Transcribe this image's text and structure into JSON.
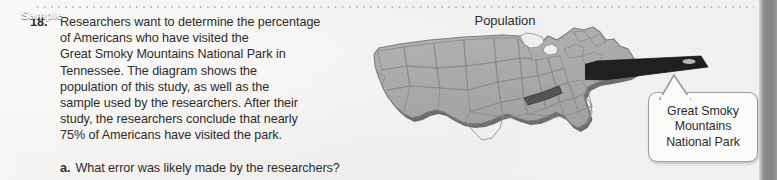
{
  "page": {
    "background_color": "#f3f2f0",
    "text_color": "#2e2c2b",
    "edge_band_color": "#8e8d8b",
    "dot_rule_color": "#c3c2c0"
  },
  "problem": {
    "number": "18.",
    "text": "Researchers want to determine the percentage of Americans who have visited the Great Smoky Mountains National Park in Tennessee. The diagram shows the population of this study, as well as the sample used by the researchers. After their study, the researchers conclude that nearly 75% of Americans have visited the park.",
    "lines": [
      "Researchers want to determine the percentage",
      "of Americans who have visited the",
      "Great Smoky Mountains National Park in",
      "Tennessee. The diagram shows the",
      "population of this study, as well as the",
      "sample used by the researchers. After their",
      "study, the researchers conclude that nearly",
      "75% of Americans have visited the park."
    ],
    "parts": [
      {
        "letter": "a.",
        "text": "What error was likely made by the researchers?"
      }
    ]
  },
  "diagram": {
    "population_label": "Population",
    "sample_label": "Sample",
    "callout_label": "Great Smoky\nMountains\nNational Park",
    "map": {
      "name": "united-states-map",
      "fill_color": "#a9a8a6",
      "outline_color": "#7c7b79",
      "state_border_color": "#8b8a88",
      "shadow_color": "#6e6d6b",
      "highlighted_state": "Tennessee",
      "highlight_color": "#555452"
    },
    "banner": {
      "fill_color": "#211f1f",
      "text_color": "#ffffff"
    },
    "callout_box": {
      "fill_color": "#fbfbfa",
      "border_color": "#9d9c9a"
    }
  }
}
